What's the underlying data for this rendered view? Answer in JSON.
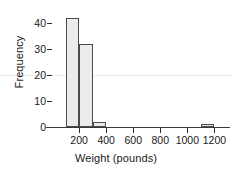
{
  "chart_data": {
    "type": "bar",
    "title": "",
    "xlabel": "Weight (pounds)",
    "ylabel": "Frequency",
    "xlim": [
      0,
      1300
    ],
    "ylim": [
      0,
      45
    ],
    "grid": false,
    "legend": null,
    "bin_width": 100,
    "categories": [
      "100-200",
      "200-300",
      "300-400",
      "1100-1200"
    ],
    "values": [
      42,
      32,
      2,
      1
    ],
    "bins": [
      {
        "label": "100-200",
        "start": 100,
        "end": 200,
        "frequency": 42
      },
      {
        "label": "200-300",
        "start": 200,
        "end": 300,
        "frequency": 32
      },
      {
        "label": "300-400",
        "start": 300,
        "end": 400,
        "frequency": 2
      },
      {
        "label": "1100-1200",
        "start": 1100,
        "end": 1200,
        "frequency": 1
      }
    ],
    "xticks": [
      {
        "value": 200,
        "label": "200"
      },
      {
        "value": 400,
        "label": "400"
      },
      {
        "value": 600,
        "label": "600"
      },
      {
        "value": 800,
        "label": "800"
      },
      {
        "value": 1000,
        "label": "1000"
      },
      {
        "value": 1200,
        "label": "1200"
      }
    ],
    "yticks": [
      {
        "value": 0,
        "label": "0"
      },
      {
        "value": 10,
        "label": "10"
      },
      {
        "value": 20,
        "label": "20"
      },
      {
        "value": 30,
        "label": "30"
      },
      {
        "value": 40,
        "label": "40"
      }
    ],
    "colors": {
      "bar_fill": "#ebebeb",
      "bar_outline": "#4a4a4a",
      "axis": "#3a3a3a",
      "text": "#1a1a1a",
      "artifact_line": "#eceaea",
      "background": "#ffffff"
    }
  }
}
